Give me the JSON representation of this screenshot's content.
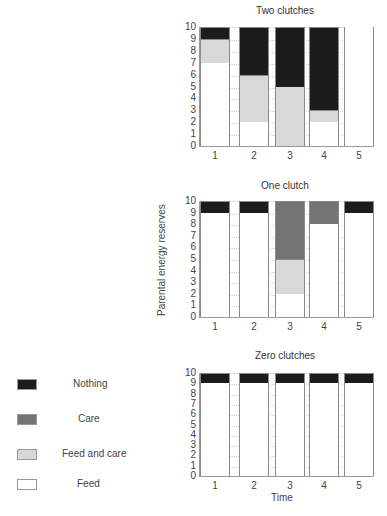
{
  "colors": {
    "nothing": "#1c1c1c",
    "care": "#4d4d4d",
    "feed_and_care": "#d8d8d8",
    "feed": "#ffffff"
  },
  "legend": {
    "items": [
      {
        "key": "nothing",
        "label": "Nothing"
      },
      {
        "key": "care",
        "label": "Care"
      },
      {
        "key": "feedcare",
        "label": "Feed and care"
      },
      {
        "key": "feed",
        "label": "Feed"
      }
    ]
  },
  "axis": {
    "ylabel": "Parental energy reserves",
    "xlabel": "Time",
    "yticks": [
      "0",
      "1",
      "2",
      "3",
      "4",
      "5",
      "6",
      "7",
      "8",
      "9",
      "10"
    ],
    "xticks": [
      "1",
      "2",
      "3",
      "4",
      "5"
    ]
  },
  "chart_data": [
    {
      "type": "bar",
      "stacked": true,
      "title": "Two clutches",
      "xlabel": "",
      "ylabel": "",
      "categories": [
        "1",
        "2",
        "3",
        "4",
        "5"
      ],
      "ylim": [
        0,
        10
      ],
      "grid": true,
      "series": [
        {
          "name": "Feed",
          "values": [
            7,
            2,
            0,
            2,
            10
          ]
        },
        {
          "name": "Feed and care",
          "values": [
            2,
            4,
            5,
            1,
            0
          ]
        },
        {
          "name": "Care",
          "values": [
            0,
            0,
            0,
            0,
            0
          ]
        },
        {
          "name": "Nothing",
          "values": [
            1,
            4,
            5,
            7,
            0
          ]
        }
      ]
    },
    {
      "type": "bar",
      "stacked": true,
      "title": "One clutch",
      "xlabel": "",
      "ylabel": "Parental energy reserves",
      "categories": [
        "1",
        "2",
        "3",
        "4",
        "5"
      ],
      "ylim": [
        0,
        10
      ],
      "grid": true,
      "series": [
        {
          "name": "Feed",
          "values": [
            9,
            9,
            2,
            8,
            9
          ]
        },
        {
          "name": "Feed and care",
          "values": [
            0,
            0,
            3,
            0,
            0
          ]
        },
        {
          "name": "Care",
          "values": [
            0,
            0,
            5,
            2,
            0
          ]
        },
        {
          "name": "Nothing",
          "values": [
            1,
            1,
            0,
            0,
            1
          ]
        }
      ]
    },
    {
      "type": "bar",
      "stacked": true,
      "title": "Zero clutches",
      "xlabel": "Time",
      "ylabel": "",
      "categories": [
        "1",
        "2",
        "3",
        "4",
        "5"
      ],
      "ylim": [
        0,
        10
      ],
      "grid": true,
      "series": [
        {
          "name": "Feed",
          "values": [
            9,
            9,
            9,
            9,
            9
          ]
        },
        {
          "name": "Feed and care",
          "values": [
            0,
            0,
            0,
            0,
            0
          ]
        },
        {
          "name": "Care",
          "values": [
            0,
            0,
            0,
            0,
            0
          ]
        },
        {
          "name": "Nothing",
          "values": [
            1,
            1,
            1,
            1,
            1
          ]
        }
      ],
      "legend_position": "left"
    }
  ]
}
